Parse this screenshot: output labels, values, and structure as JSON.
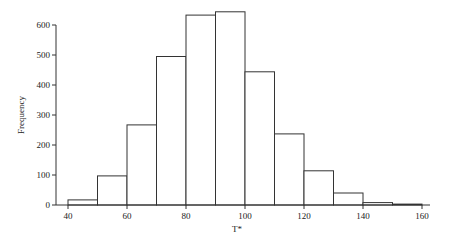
{
  "chart_data": {
    "type": "bar",
    "subtype": "histogram",
    "title": "",
    "xlabel": "T*",
    "ylabel": "Frequency",
    "bins": [
      {
        "from": 40,
        "to": 50,
        "value": 17
      },
      {
        "from": 50,
        "to": 60,
        "value": 97
      },
      {
        "from": 60,
        "to": 70,
        "value": 267
      },
      {
        "from": 70,
        "to": 80,
        "value": 495
      },
      {
        "from": 80,
        "to": 90,
        "value": 633
      },
      {
        "from": 90,
        "to": 100,
        "value": 644
      },
      {
        "from": 100,
        "to": 110,
        "value": 444
      },
      {
        "from": 110,
        "to": 120,
        "value": 237
      },
      {
        "from": 120,
        "to": 130,
        "value": 114
      },
      {
        "from": 130,
        "to": 140,
        "value": 40
      },
      {
        "from": 140,
        "to": 150,
        "value": 8
      },
      {
        "from": 150,
        "to": 160,
        "value": 3
      }
    ],
    "categories": [
      "40-50",
      "50-60",
      "60-70",
      "70-80",
      "80-90",
      "90-100",
      "100-110",
      "110-120",
      "120-130",
      "130-140",
      "140-150",
      "150-160"
    ],
    "values": [
      17,
      97,
      267,
      495,
      633,
      644,
      444,
      237,
      114,
      40,
      8,
      3
    ],
    "xlim": [
      40,
      160
    ],
    "ylim": [
      0,
      600
    ],
    "xticks": [
      40,
      60,
      80,
      100,
      120,
      140,
      160
    ],
    "yticks": [
      0,
      100,
      200,
      300,
      400,
      500,
      600
    ],
    "grid": false,
    "legend": null
  }
}
